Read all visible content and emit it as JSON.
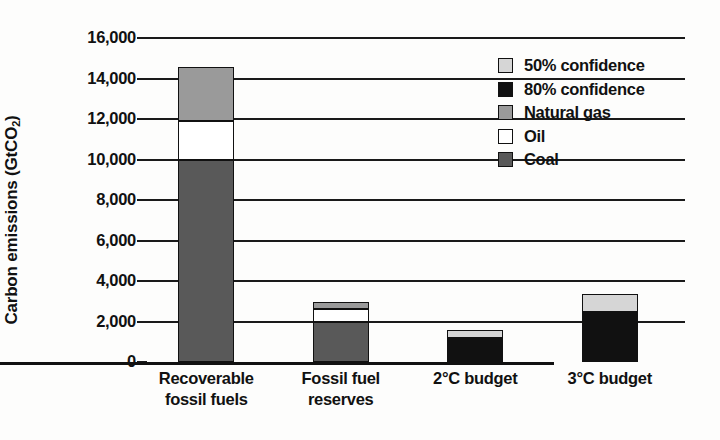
{
  "chart_data": {
    "type": "bar",
    "subtype": "stacked",
    "title": "",
    "xlabel": "",
    "ylabel": "Carbon emissions (GtCO2)",
    "ylabel_main": "Carbon emissions (GtCO",
    "ylabel_sub": "2",
    "ylabel_tail": ")",
    "ylim": [
      0,
      16000
    ],
    "ytick_step": 2000,
    "ytick_labels": [
      "16,000",
      "14,000",
      "12,000",
      "10,000",
      "8,000",
      "6,000",
      "4,000",
      "2,000",
      "0"
    ],
    "ytick_values": [
      16000,
      14000,
      12000,
      10000,
      8000,
      6000,
      4000,
      2000,
      0
    ],
    "grid": true,
    "grid_axis": "y",
    "legend_position": "top-right",
    "categories": [
      "Recoverable fossil fuels",
      "Fossil fuel reserves",
      "2°C budget",
      "3°C budget"
    ],
    "category_labels": [
      [
        "Recoverable",
        "fossil fuels"
      ],
      [
        "Fossil fuel",
        "reserves"
      ],
      [
        "2°C budget",
        ""
      ],
      [
        "3°C budget",
        ""
      ]
    ],
    "series": [
      {
        "name": "Coal",
        "color": "#595959",
        "values": [
          9970,
          1975,
          null,
          null
        ]
      },
      {
        "name": "Oil",
        "color": "#ffffff",
        "values": [
          1930,
          645,
          null,
          null
        ]
      },
      {
        "name": "Natural gas",
        "color": "#9a9a9a",
        "values": [
          2670,
          340,
          null,
          null
        ]
      },
      {
        "name": "80% confidence",
        "color": "#111111",
        "values": [
          null,
          null,
          1185,
          2470
        ]
      },
      {
        "name": "50% confidence",
        "color": "#d6d6d6",
        "values": [
          null,
          null,
          395,
          890
        ]
      }
    ],
    "bar_totals": [
      14570,
      2960,
      1580,
      3360
    ],
    "stacks": [
      {
        "category": "Recoverable fossil fuels",
        "segments": [
          {
            "series": "Coal",
            "value": 9970,
            "from": 0,
            "to": 9970
          },
          {
            "series": "Oil",
            "value": 1930,
            "from": 9970,
            "to": 11900
          },
          {
            "series": "Natural gas",
            "value": 2670,
            "from": 11900,
            "to": 14570
          }
        ]
      },
      {
        "category": "Fossil fuel reserves",
        "segments": [
          {
            "series": "Coal",
            "value": 1975,
            "from": 0,
            "to": 1975
          },
          {
            "series": "Oil",
            "value": 645,
            "from": 1975,
            "to": 2620
          },
          {
            "series": "Natural gas",
            "value": 340,
            "from": 2620,
            "to": 2960
          }
        ]
      },
      {
        "category": "2°C budget",
        "segments": [
          {
            "series": "80% confidence",
            "value": 1185,
            "from": 0,
            "to": 1185
          },
          {
            "series": "50% confidence",
            "value": 395,
            "from": 1185,
            "to": 1580
          }
        ]
      },
      {
        "category": "3°C budget",
        "segments": [
          {
            "series": "80% confidence",
            "value": 2470,
            "from": 0,
            "to": 2470
          },
          {
            "series": "50% confidence",
            "value": 890,
            "from": 2470,
            "to": 3360
          }
        ]
      }
    ],
    "legend": [
      {
        "label": "50% confidence",
        "color": "#d6d6d6"
      },
      {
        "label": "80% confidence",
        "color": "#111111"
      },
      {
        "label": "Natural gas",
        "color": "#9a9a9a"
      },
      {
        "label": "Oil",
        "color": "#ffffff"
      },
      {
        "label": "Coal",
        "color": "#595959"
      }
    ]
  }
}
